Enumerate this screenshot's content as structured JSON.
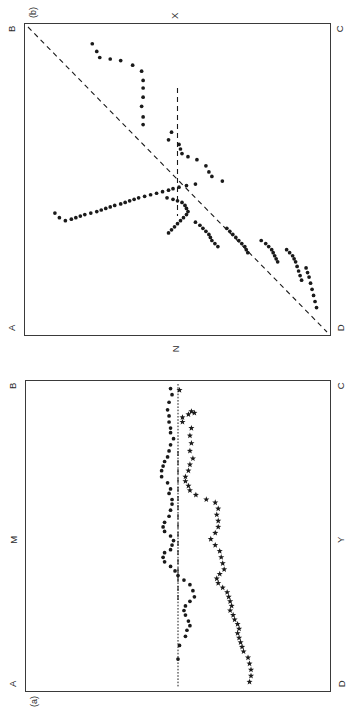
{
  "figure": {
    "orientation": "rotated-90-ccw",
    "background": "#ffffff",
    "ink_color": "#1a1a1a",
    "frame_color": "#3a3a3a"
  },
  "panels": {
    "b": {
      "tag": "(b)",
      "corners": {
        "top_left": "B",
        "top_right": "C",
        "bottom_left": "A",
        "bottom_right": "D"
      },
      "axis_labels": {
        "top": "X",
        "bottom": "N"
      }
    },
    "a": {
      "tag": "(a)",
      "corners": {
        "top_left": "B",
        "top_right": "C",
        "bottom_left": "A",
        "bottom_right": "D"
      },
      "axis_labels": {
        "left": "M",
        "right": "Y"
      }
    }
  },
  "chart_data": [
    {
      "id": "panel-b",
      "type": "scatter",
      "title": "(b)",
      "xlabel": "N",
      "ylabel": "X",
      "xlim": [
        0,
        100
      ],
      "ylim": [
        0,
        100
      ],
      "grid": false,
      "legend": "none",
      "annotations": [
        {
          "kind": "identity-line",
          "style": "dashed",
          "from": [
            0,
            0
          ],
          "to": [
            100,
            100
          ],
          "label": "A-to-C diagonal"
        },
        {
          "kind": "vertical-line",
          "style": "dashed",
          "x": 50,
          "y_from": 20,
          "y_to": 62
        }
      ],
      "series": [
        {
          "name": "trajectory",
          "marker": "filled-circle",
          "points": [
            [
              5.5,
              21.5
            ],
            [
              8.0,
              23.0
            ],
            [
              10.0,
              24.0
            ],
            [
              10.5,
              27.5
            ],
            [
              11.0,
              31.0
            ],
            [
              12.5,
              35.0
            ],
            [
              14.5,
              38.0
            ],
            [
              17.5,
              38.5
            ],
            [
              20.0,
              38.5
            ],
            [
              23.0,
              38.5
            ],
            [
              26.0,
              38.0
            ],
            [
              29.5,
              38.5
            ],
            [
              32.0,
              38.5
            ],
            [
              34.5,
              48.0
            ],
            [
              37.0,
              47.0
            ],
            [
              38.5,
              50.5
            ],
            [
              40.0,
              51.0
            ],
            [
              41.5,
              51.5
            ],
            [
              42.5,
              53.5
            ],
            [
              43.5,
              56.5
            ],
            [
              45.5,
              59.5
            ],
            [
              47.5,
              60.5
            ],
            [
              49.0,
              61.5
            ],
            [
              50.5,
              65.0
            ],
            [
              51.5,
              56.0
            ],
            [
              52.0,
              53.0
            ],
            [
              52.5,
              50.5
            ],
            [
              53.0,
              48.5
            ],
            [
              53.5,
              47.0
            ],
            [
              54.0,
              45.0
            ],
            [
              54.5,
              43.0
            ],
            [
              55.0,
              41.0
            ],
            [
              55.5,
              39.0
            ],
            [
              56.0,
              37.0
            ],
            [
              56.5,
              35.5
            ],
            [
              57.0,
              34.0
            ],
            [
              57.5,
              32.5
            ],
            [
              58.0,
              31.0
            ],
            [
              58.5,
              29.0
            ],
            [
              59.0,
              27.5
            ],
            [
              59.5,
              26.0
            ],
            [
              60.0,
              24.5
            ],
            [
              60.5,
              23.0
            ],
            [
              61.0,
              21.0
            ],
            [
              61.5,
              19.0
            ],
            [
              62.0,
              17.5
            ],
            [
              62.5,
              16.0
            ],
            [
              63.0,
              14.5
            ],
            [
              63.5,
              12.5
            ],
            [
              62.5,
              10.5
            ],
            [
              61.0,
              9.0
            ],
            [
              56.0,
              46.5
            ],
            [
              56.5,
              48.5
            ],
            [
              57.0,
              50.0
            ],
            [
              57.5,
              51.5
            ],
            [
              58.5,
              52.5
            ],
            [
              59.5,
              53.0
            ],
            [
              60.5,
              53.5
            ],
            [
              61.5,
              53.0
            ],
            [
              62.5,
              52.0
            ],
            [
              63.5,
              51.0
            ],
            [
              64.5,
              50.0
            ],
            [
              65.5,
              49.0
            ],
            [
              66.5,
              48.0
            ],
            [
              67.5,
              47.0
            ],
            [
              64.0,
              56.0
            ],
            [
              65.0,
              57.5
            ],
            [
              66.0,
              58.5
            ],
            [
              67.0,
              59.5
            ],
            [
              68.0,
              60.5
            ],
            [
              69.0,
              61.0
            ],
            [
              70.0,
              61.5
            ],
            [
              71.0,
              62.5
            ],
            [
              72.0,
              63.5
            ],
            [
              66.0,
              66.5
            ],
            [
              67.0,
              67.5
            ],
            [
              68.0,
              68.5
            ],
            [
              69.0,
              69.5
            ],
            [
              70.0,
              70.5
            ],
            [
              71.0,
              71.5
            ],
            [
              72.0,
              72.5
            ],
            [
              73.0,
              73.0
            ],
            [
              74.0,
              73.5
            ],
            [
              70.0,
              78.0
            ],
            [
              71.0,
              79.5
            ],
            [
              72.0,
              80.5
            ],
            [
              73.0,
              81.5
            ],
            [
              74.0,
              82.0
            ],
            [
              75.0,
              82.5
            ],
            [
              76.0,
              83.0
            ],
            [
              77.0,
              83.5
            ],
            [
              73.0,
              86.5
            ],
            [
              74.0,
              87.5
            ],
            [
              75.0,
              88.5
            ],
            [
              76.0,
              89.0
            ],
            [
              77.0,
              89.5
            ],
            [
              78.5,
              90.0
            ],
            [
              80.0,
              90.5
            ],
            [
              81.5,
              91.0
            ],
            [
              83.0,
              91.5
            ],
            [
              79.0,
              93.0
            ],
            [
              80.5,
              93.5
            ],
            [
              82.0,
              94.0
            ],
            [
              84.0,
              94.5
            ],
            [
              86.0,
              95.0
            ],
            [
              88.0,
              95.5
            ],
            [
              90.0,
              96.0
            ],
            [
              92.0,
              96.5
            ]
          ]
        }
      ]
    },
    {
      "id": "panel-a",
      "type": "scatter",
      "title": "(a)",
      "xlabel": "",
      "ylabel": "",
      "xlim": [
        0,
        100
      ],
      "ylim": [
        0,
        100
      ],
      "grid": false,
      "legend": "none",
      "annotations": [
        {
          "kind": "horizontal-line",
          "style": "dotted",
          "y": 50,
          "label_left": "M",
          "label_right": "Y"
        },
        {
          "kind": "vertical-line",
          "style": "dashed",
          "x": 50,
          "y_from": 22,
          "y_to": 72
        }
      ],
      "series": [
        {
          "name": "upper-series",
          "marker": "filled-star",
          "points": [
            [
              2.0,
              50.5
            ],
            [
              9.0,
              54.5
            ],
            [
              9.5,
              55.5
            ],
            [
              10.0,
              53.5
            ],
            [
              11.0,
              51.5
            ],
            [
              12.5,
              51.5
            ],
            [
              14.5,
              54.5
            ],
            [
              17.0,
              54.0
            ],
            [
              19.5,
              54.5
            ],
            [
              22.0,
              54.0
            ],
            [
              24.5,
              55.0
            ],
            [
              26.5,
              54.0
            ],
            [
              28.5,
              53.5
            ],
            [
              30.5,
              52.5
            ],
            [
              32.0,
              52.5
            ],
            [
              33.5,
              53.5
            ],
            [
              35.0,
              54.0
            ],
            [
              36.5,
              56.0
            ],
            [
              38.0,
              59.5
            ],
            [
              39.0,
              62.5
            ],
            [
              41.0,
              63.5
            ],
            [
              43.0,
              63.0
            ],
            [
              45.0,
              63.5
            ],
            [
              47.0,
              63.5
            ],
            [
              49.0,
              62.5
            ],
            [
              51.0,
              61.0
            ],
            [
              53.0,
              62.5
            ],
            [
              55.0,
              64.0
            ],
            [
              57.0,
              64.5
            ],
            [
              59.0,
              65.0
            ],
            [
              61.0,
              65.5
            ],
            [
              62.5,
              64.0
            ],
            [
              64.0,
              63.0
            ],
            [
              65.5,
              63.5
            ],
            [
              67.0,
              65.0
            ],
            [
              68.5,
              66.5
            ],
            [
              70.0,
              67.0
            ],
            [
              71.5,
              67.5
            ],
            [
              73.0,
              68.0
            ],
            [
              74.5,
              67.5
            ],
            [
              76.0,
              68.5
            ],
            [
              77.5,
              69.0
            ],
            [
              79.0,
              70.0
            ],
            [
              80.5,
              70.5
            ],
            [
              82.0,
              70.0
            ],
            [
              83.5,
              70.5
            ],
            [
              85.0,
              71.0
            ],
            [
              86.5,
              71.5
            ],
            [
              88.0,
              72.0
            ],
            [
              90.0,
              73.5
            ],
            [
              92.0,
              74.0
            ],
            [
              94.0,
              74.5
            ],
            [
              96.0,
              74.5
            ],
            [
              98.0,
              74.0
            ]
          ]
        },
        {
          "name": "lower-series",
          "marker": "filled-circle",
          "points": [
            [
              1.5,
              47.5
            ],
            [
              3.5,
              48.0
            ],
            [
              6.0,
              47.0
            ],
            [
              8.5,
              46.5
            ],
            [
              10.5,
              47.0
            ],
            [
              12.5,
              47.0
            ],
            [
              14.5,
              47.5
            ],
            [
              16.0,
              47.5
            ],
            [
              18.0,
              48.5
            ],
            [
              20.0,
              47.5
            ],
            [
              22.0,
              47.0
            ],
            [
              24.0,
              46.5
            ],
            [
              25.5,
              45.5
            ],
            [
              27.0,
              45.0
            ],
            [
              28.5,
              44.5
            ],
            [
              30.5,
              44.5
            ],
            [
              32.5,
              46.5
            ],
            [
              34.5,
              47.5
            ],
            [
              36.0,
              47.0
            ],
            [
              38.0,
              48.0
            ],
            [
              39.5,
              48.0
            ],
            [
              41.5,
              47.5
            ],
            [
              43.5,
              47.0
            ],
            [
              45.5,
              45.5
            ],
            [
              47.0,
              45.0
            ],
            [
              48.5,
              45.5
            ],
            [
              50.0,
              47.5
            ],
            [
              51.5,
              48.5
            ],
            [
              53.0,
              48.0
            ],
            [
              54.5,
              47.5
            ],
            [
              55.5,
              45.5
            ],
            [
              57.0,
              45.0
            ],
            [
              58.5,
              45.5
            ],
            [
              60.0,
              47.5
            ],
            [
              61.5,
              49.0
            ],
            [
              63.0,
              50.0
            ],
            [
              64.5,
              52.0
            ],
            [
              66.0,
              54.0
            ],
            [
              68.0,
              55.0
            ],
            [
              70.0,
              55.5
            ],
            [
              71.5,
              54.0
            ],
            [
              73.0,
              52.5
            ],
            [
              74.5,
              52.0
            ],
            [
              76.0,
              52.5
            ],
            [
              78.0,
              53.5
            ],
            [
              79.5,
              54.0
            ],
            [
              81.0,
              53.0
            ],
            [
              83.0,
              52.5
            ],
            [
              86.0,
              50.5
            ],
            [
              90.5,
              50.0
            ]
          ]
        }
      ]
    }
  ]
}
